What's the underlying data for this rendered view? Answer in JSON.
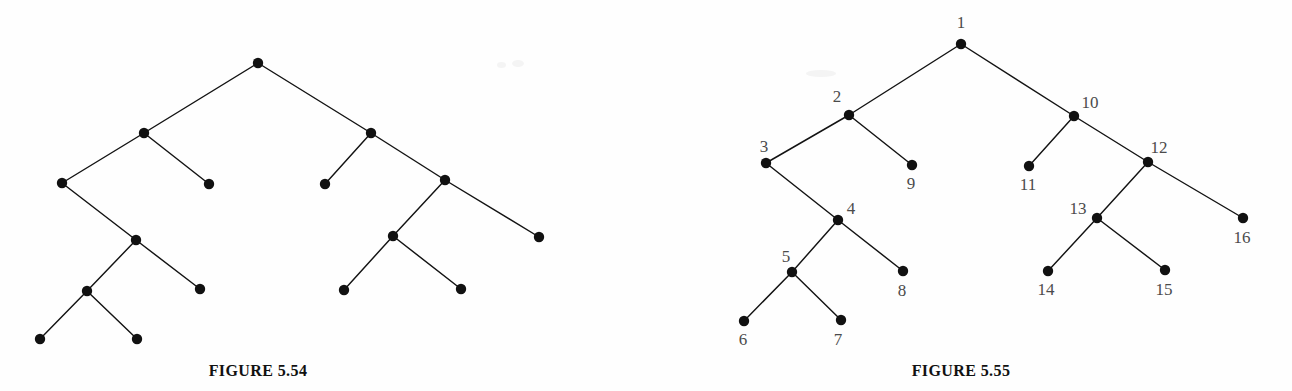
{
  "page": {
    "width": 1292,
    "height": 391,
    "background": "#fefefe",
    "ink_color": "#111111",
    "label_color": "#4b4b4b"
  },
  "figures": [
    {
      "id": "figure-5-54",
      "caption": "FIGURE 5.54",
      "labels_shown": false,
      "node_radius": 5.2,
      "nodes": [
        {
          "id": "L1",
          "label": "",
          "x": 258,
          "y": 63
        },
        {
          "id": "L2",
          "label": "",
          "x": 144,
          "y": 133
        },
        {
          "id": "L3",
          "label": "",
          "x": 62,
          "y": 183
        },
        {
          "id": "L4",
          "label": "",
          "x": 209,
          "y": 184
        },
        {
          "id": "L5",
          "label": "",
          "x": 136,
          "y": 240
        },
        {
          "id": "L6",
          "label": "",
          "x": 87,
          "y": 291
        },
        {
          "id": "L7",
          "label": "",
          "x": 200,
          "y": 289
        },
        {
          "id": "L8",
          "label": "",
          "x": 40,
          "y": 339
        },
        {
          "id": "L9",
          "label": "",
          "x": 137,
          "y": 339
        },
        {
          "id": "R1",
          "label": "",
          "x": 371,
          "y": 133
        },
        {
          "id": "R2",
          "label": "",
          "x": 325,
          "y": 184
        },
        {
          "id": "R3",
          "label": "",
          "x": 445,
          "y": 180
        },
        {
          "id": "R4",
          "label": "",
          "x": 393,
          "y": 236
        },
        {
          "id": "R5",
          "label": "",
          "x": 539,
          "y": 237
        },
        {
          "id": "R6",
          "label": "",
          "x": 344,
          "y": 290
        },
        {
          "id": "R7",
          "label": "",
          "x": 461,
          "y": 289
        }
      ],
      "edges": [
        [
          "L1",
          "L2"
        ],
        [
          "L1",
          "R1"
        ],
        [
          "L2",
          "L3"
        ],
        [
          "L2",
          "L4"
        ],
        [
          "L3",
          "L5"
        ],
        [
          "L5",
          "L6"
        ],
        [
          "L5",
          "L7"
        ],
        [
          "L6",
          "L8"
        ],
        [
          "L6",
          "L9"
        ],
        [
          "R1",
          "R2"
        ],
        [
          "R1",
          "R3"
        ],
        [
          "R3",
          "R4"
        ],
        [
          "R3",
          "R5"
        ],
        [
          "R4",
          "R6"
        ],
        [
          "R4",
          "R7"
        ]
      ]
    },
    {
      "id": "figure-5-55",
      "caption": "FIGURE 5.55",
      "labels_shown": true,
      "node_radius": 5.2,
      "nodes": [
        {
          "id": "n1",
          "label": "1",
          "x": 961,
          "y": 44,
          "lx": 961,
          "ly": 28
        },
        {
          "id": "n2",
          "label": "2",
          "x": 849,
          "y": 115,
          "lx": 837,
          "ly": 102
        },
        {
          "id": "n3",
          "label": "3",
          "x": 766,
          "y": 163,
          "lx": 764,
          "ly": 152
        },
        {
          "id": "n4",
          "label": "4",
          "x": 838,
          "y": 220,
          "lx": 851,
          "ly": 214
        },
        {
          "id": "n5",
          "label": "5",
          "x": 792,
          "y": 272,
          "lx": 786,
          "ly": 262
        },
        {
          "id": "n6",
          "label": "6",
          "x": 744,
          "y": 321,
          "lx": 743,
          "ly": 345
        },
        {
          "id": "n7",
          "label": "7",
          "x": 841,
          "y": 320,
          "lx": 838,
          "ly": 345
        },
        {
          "id": "n8",
          "label": "8",
          "x": 903,
          "y": 271,
          "lx": 902,
          "ly": 296
        },
        {
          "id": "n9",
          "label": "9",
          "x": 912,
          "y": 165,
          "lx": 911,
          "ly": 189
        },
        {
          "id": "n10",
          "label": "10",
          "x": 1074,
          "y": 116,
          "lx": 1090,
          "ly": 108
        },
        {
          "id": "n11",
          "label": "11",
          "x": 1029,
          "y": 166,
          "lx": 1028,
          "ly": 190
        },
        {
          "id": "n12",
          "label": "12",
          "x": 1148,
          "y": 162,
          "lx": 1159,
          "ly": 153
        },
        {
          "id": "n13",
          "label": "13",
          "x": 1097,
          "y": 218,
          "lx": 1078,
          "ly": 214
        },
        {
          "id": "n14",
          "label": "14",
          "x": 1048,
          "y": 271,
          "lx": 1046,
          "ly": 295
        },
        {
          "id": "n15",
          "label": "15",
          "x": 1165,
          "y": 270,
          "lx": 1164,
          "ly": 295
        },
        {
          "id": "n16",
          "label": "16",
          "x": 1243,
          "y": 218,
          "lx": 1242,
          "ly": 243
        }
      ],
      "edges": [
        [
          "n1",
          "n2"
        ],
        [
          "n1",
          "n10"
        ],
        [
          "n2",
          "n3"
        ],
        [
          "n2",
          "n9"
        ],
        [
          "n3",
          "n4"
        ],
        [
          "n4",
          "n5"
        ],
        [
          "n4",
          "n8"
        ],
        [
          "n5",
          "n6"
        ],
        [
          "n5",
          "n7"
        ],
        [
          "n10",
          "n11"
        ],
        [
          "n10",
          "n12"
        ],
        [
          "n12",
          "n13"
        ],
        [
          "n12",
          "n16"
        ],
        [
          "n13",
          "n14"
        ],
        [
          "n13",
          "n15"
        ]
      ]
    }
  ],
  "artifacts": [
    {
      "x": 497,
      "y": 62,
      "w": 9,
      "h": 6
    },
    {
      "x": 512,
      "y": 60,
      "w": 12,
      "h": 7
    },
    {
      "x": 806,
      "y": 70,
      "w": 30,
      "h": 7
    }
  ]
}
